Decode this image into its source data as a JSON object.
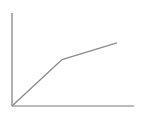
{
  "chart_data": {
    "type": "line",
    "title": "",
    "xlabel": "",
    "ylabel": "",
    "grid": false,
    "legend": null,
    "x": [
      0,
      0.41,
      0.86
    ],
    "series": [
      {
        "name": "",
        "values": [
          0,
          0.5,
          0.68
        ]
      }
    ],
    "xlim": [
      0,
      1
    ],
    "ylim": [
      0,
      1
    ],
    "colors": {
      "axis": "#7a7a7a",
      "line": "#8c8c8c"
    }
  }
}
